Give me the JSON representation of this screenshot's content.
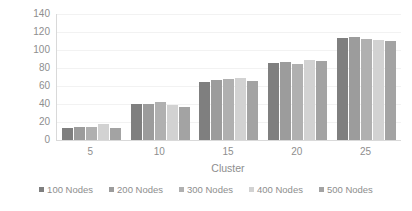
{
  "chart_data": {
    "type": "bar",
    "title": "",
    "xlabel": "Cluster",
    "ylabel": "Energy Consumption",
    "categories": [
      "5",
      "10",
      "15",
      "20",
      "25"
    ],
    "ylim": [
      0,
      140
    ],
    "yticks": [
      0,
      20,
      40,
      60,
      80,
      100,
      120,
      140
    ],
    "grid": true,
    "legend_position": "bottom",
    "series": [
      {
        "name": "100 Nodes",
        "color": "#7f7f7f",
        "values": [
          13,
          40,
          65,
          86,
          113.5
        ]
      },
      {
        "name": "200 Nodes",
        "color": "#9c9c9c",
        "values": [
          14,
          40.5,
          67,
          87,
          115
        ]
      },
      {
        "name": "300 Nodes",
        "color": "#b0b0b0",
        "values": [
          15,
          42,
          68,
          84.5,
          112
        ]
      },
      {
        "name": "400 Nodes",
        "color": "#d2d2d2",
        "values": [
          18,
          38.5,
          69,
          89,
          111.5
        ]
      },
      {
        "name": "500 Nodes",
        "color": "#a3a3a3",
        "values": [
          13,
          37,
          66,
          88,
          110
        ]
      }
    ]
  }
}
